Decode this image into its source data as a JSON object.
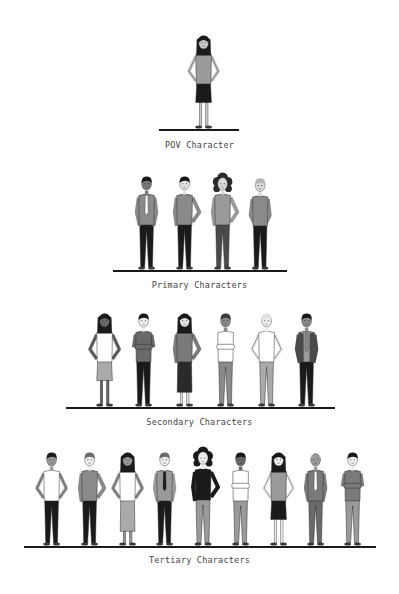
{
  "tiers": [
    {
      "label": "POV Character",
      "line": {
        "x1": 159,
        "x2": 239,
        "y": 130
      },
      "label_y": 140,
      "figures": [
        {
          "x": 204,
          "h": 98,
          "sex": "f",
          "hair": "long",
          "skin": "#c9c9c9",
          "hairColor": "#1a1a1a",
          "top": "#9a9a9a",
          "bottom": "#1a1a1a",
          "bottomType": "skirt",
          "pose": "hips",
          "tie": null
        }
      ]
    },
    {
      "label": "Primary Characters",
      "line": {
        "x1": 113,
        "x2": 287,
        "y": 271
      },
      "label_y": 280,
      "figures": [
        {
          "x": 147,
          "h": 98,
          "sex": "m",
          "hair": "short",
          "skin": "#7a7a7a",
          "hairColor": "#1a1a1a",
          "top": "#8a8a8a",
          "bottom": "#1a1a1a",
          "bottomType": "pants",
          "pose": "pockets",
          "tie": "#ffffff"
        },
        {
          "x": 185,
          "h": 98,
          "sex": "m",
          "hair": "short",
          "skin": "#e5e5e5",
          "hairColor": "#1a1a1a",
          "top": "#8a8a8a",
          "bottom": "#1a1a1a",
          "bottomType": "pants",
          "pose": "hip-one",
          "tie": null
        },
        {
          "x": 223,
          "h": 98,
          "sex": "f",
          "hair": "curly",
          "skin": "#d9d9d9",
          "hairColor": "#2a2a2a",
          "top": "#9a9a9a",
          "bottom": "#4a4a4a",
          "bottomType": "pants",
          "pose": "hip-one",
          "tie": null
        },
        {
          "x": 260,
          "h": 96,
          "sex": "m",
          "hair": "short",
          "skin": "#d9d9d9",
          "hairColor": "#b5b5b5",
          "top": "#8a8a8a",
          "bottom": "#1a1a1a",
          "bottomType": "pants",
          "pose": "behind",
          "tie": null
        }
      ]
    },
    {
      "label": "Secondary Characters",
      "line": {
        "x1": 66,
        "x2": 335,
        "y": 408
      },
      "label_y": 417,
      "figures": [
        {
          "x": 105,
          "h": 98,
          "sex": "f",
          "hair": "long",
          "skin": "#6a6a6a",
          "hairColor": "#1a1a1a",
          "top": "#ffffff",
          "bottom": "#aaaaaa",
          "bottomType": "skirt",
          "pose": "hips",
          "tie": null
        },
        {
          "x": 144,
          "h": 98,
          "sex": "m",
          "hair": "short",
          "skin": "#eeeeee",
          "hairColor": "#1a1a1a",
          "top": "#6a6a6a",
          "bottom": "#1a1a1a",
          "bottomType": "pants",
          "pose": "crossed",
          "tie": null
        },
        {
          "x": 185,
          "h": 98,
          "sex": "f",
          "hair": "long",
          "skin": "#e5e5e5",
          "hairColor": "#1a1a1a",
          "top": "#7a7a7a",
          "bottom": "#2a2a2a",
          "bottomType": "longskirt",
          "pose": "hip-one",
          "tie": null
        },
        {
          "x": 226,
          "h": 98,
          "sex": "m",
          "hair": "short",
          "skin": "#8a8a8a",
          "hairColor": "#3a3a3a",
          "top": "#ffffff",
          "bottom": "#8a8a8a",
          "bottomType": "pants",
          "pose": "crossed",
          "tie": null
        },
        {
          "x": 267,
          "h": 98,
          "sex": "m",
          "hair": "short",
          "skin": "#eeeeee",
          "hairColor": "#e0e0e0",
          "top": "#ffffff",
          "bottom": "#aaaaaa",
          "bottomType": "pants",
          "pose": "hips",
          "tie": null
        },
        {
          "x": 307,
          "h": 98,
          "sex": "m",
          "hair": "short",
          "skin": "#8a8a8a",
          "hairColor": "#1a1a1a",
          "top": "#4a4a4a",
          "bottom": "#1a1a1a",
          "bottomType": "pants",
          "pose": "pockets",
          "tie": "#8a8a8a",
          "shirt": "#9a9a9a"
        }
      ]
    },
    {
      "label": "Tertiary Characters",
      "line": {
        "x1": 24,
        "x2": 376,
        "y": 547
      },
      "label_y": 555,
      "figures": [
        {
          "x": 52,
          "h": 98,
          "sex": "m",
          "hair": "short",
          "skin": "#9a9a9a",
          "hairColor": "#1a1a1a",
          "top": "#ffffff",
          "bottom": "#1a1a1a",
          "bottomType": "pants",
          "pose": "hips",
          "tie": null
        },
        {
          "x": 90,
          "h": 98,
          "sex": "m",
          "hair": "short",
          "skin": "#eeeeee",
          "hairColor": "#6a6a6a",
          "top": "#8a8a8a",
          "bottom": "#1a1a1a",
          "bottomType": "pants",
          "pose": "hip-one",
          "tie": null
        },
        {
          "x": 128,
          "h": 98,
          "sex": "f",
          "hair": "long",
          "skin": "#9a9a9a",
          "hairColor": "#1a1a1a",
          "top": "#ffffff",
          "bottom": "#aaaaaa",
          "bottomType": "longskirt",
          "pose": "hips",
          "tie": null
        },
        {
          "x": 165,
          "h": 98,
          "sex": "m",
          "hair": "short",
          "skin": "#eeeeee",
          "hairColor": "#6a6a6a",
          "top": "#9a9a9a",
          "bottom": "#1a1a1a",
          "bottomType": "pants",
          "pose": "pockets",
          "tie": "#1a1a1a"
        },
        {
          "x": 203,
          "h": 100,
          "sex": "f",
          "hair": "curly",
          "skin": "#eeeeee",
          "hairColor": "#1a1a1a",
          "top": "#1a1a1a",
          "bottom": "#9a9a9a",
          "bottomType": "pants",
          "pose": "hip-one",
          "tie": null
        },
        {
          "x": 241,
          "h": 98,
          "sex": "m",
          "hair": "short",
          "skin": "#6a6a6a",
          "hairColor": "#1a1a1a",
          "top": "#ffffff",
          "bottom": "#9a9a9a",
          "bottomType": "pants",
          "pose": "crossed",
          "tie": null
        },
        {
          "x": 279,
          "h": 98,
          "sex": "f",
          "hair": "long",
          "skin": "#eeeeee",
          "hairColor": "#1a1a1a",
          "top": "#9a9a9a",
          "bottom": "#1a1a1a",
          "bottomType": "skirt",
          "pose": "hips",
          "tie": null
        },
        {
          "x": 316,
          "h": 98,
          "sex": "m",
          "hair": "bald",
          "skin": "#9a9a9a",
          "hairColor": "#cccccc",
          "top": "#7a7a7a",
          "bottom": "#6a6a6a",
          "bottomType": "pants",
          "pose": "pockets",
          "tie": "#ffffff"
        },
        {
          "x": 353,
          "h": 98,
          "sex": "m",
          "hair": "short",
          "skin": "#eeeeee",
          "hairColor": "#1a1a1a",
          "top": "#7a7a7a",
          "bottom": "#9a9a9a",
          "bottomType": "pants",
          "pose": "crossed",
          "tie": null
        }
      ]
    }
  ],
  "colors": {
    "ground": "#1a1a1a",
    "label": "#444444",
    "background": "#ffffff"
  }
}
